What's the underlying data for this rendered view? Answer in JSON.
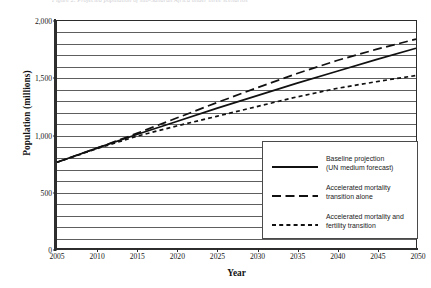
{
  "caption": "Figure 2. Projected population of sub-Saharan Africa under three scenarios",
  "chart_data": {
    "type": "line",
    "title": "",
    "xlabel": "Year",
    "ylabel": "Population (millions)",
    "xlim": [
      2005,
      2050
    ],
    "ylim": [
      0,
      2000
    ],
    "xticks": [
      "2005",
      "2010",
      "2015",
      "2020",
      "2025",
      "2030",
      "2035",
      "2040",
      "2045",
      "2050"
    ],
    "yticks": [
      "0",
      "500",
      "1,000",
      "1,500",
      "2,000"
    ],
    "y_minor_step": 100,
    "grid": "horizontal",
    "legend_position": "inside-bottom-right",
    "x": [
      2005,
      2010,
      2015,
      2020,
      2025,
      2030,
      2035,
      2040,
      2045,
      2050
    ],
    "series": [
      {
        "name": "Baseline projection\n(UN medium forecast)",
        "style": "solid",
        "color": "#111111",
        "values": [
          755,
          880,
          1000,
          1115,
          1230,
          1340,
          1450,
          1555,
          1660,
          1760
        ]
      },
      {
        "name": "Accelerated mortality\ntransition alone",
        "style": "long-dash",
        "color": "#111111",
        "values": [
          755,
          880,
          1010,
          1145,
          1280,
          1410,
          1535,
          1650,
          1750,
          1840
        ]
      },
      {
        "name": "Accelerated mortality and\nfertility transition",
        "style": "short-dash",
        "color": "#111111",
        "values": [
          755,
          875,
          985,
          1075,
          1160,
          1245,
          1330,
          1405,
          1465,
          1520
        ]
      }
    ]
  },
  "legend": {
    "items": [
      {
        "label": "Baseline projection\n(UN medium forecast)",
        "style": "solid"
      },
      {
        "label": "Accelerated mortality\ntransition alone",
        "style": "long-dash"
      },
      {
        "label": "Accelerated mortality and\nfertility transition",
        "style": "short-dash"
      }
    ]
  }
}
